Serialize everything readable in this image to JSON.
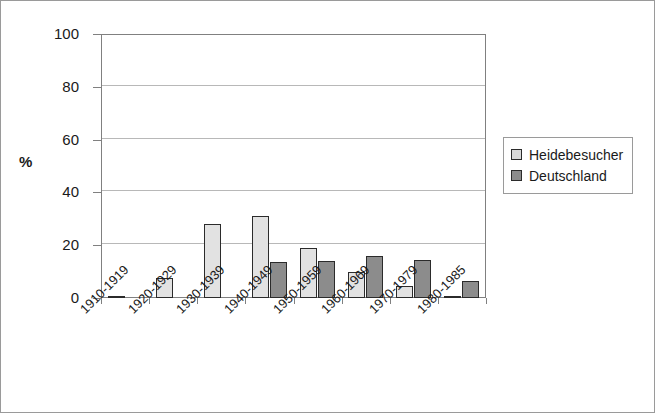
{
  "chart_data": {
    "type": "bar",
    "title": "",
    "subtitle": "",
    "xlabel": "",
    "ylabel": "%",
    "ylim": [
      0,
      100
    ],
    "yticks": [
      0,
      20,
      40,
      60,
      80,
      100
    ],
    "grid": true,
    "legend_position": "right",
    "categories": [
      "1910-1919",
      "1920-1929",
      "1930-1939",
      "1940-1949",
      "1950-1959",
      "1960-1969",
      "1970-1979",
      "1980-1985"
    ],
    "series": [
      {
        "name": "Heidebesucher",
        "color": "#e2e2e2",
        "values": [
          0.5,
          7.5,
          28,
          31,
          19,
          10,
          4.5,
          0.5
        ]
      },
      {
        "name": "Deutschland",
        "color": "#8c8c8c",
        "values": [
          0,
          0,
          0,
          13.5,
          14,
          16,
          14.5,
          6.5
        ]
      }
    ]
  },
  "axes": {
    "y_title": "%",
    "y_tick_labels": [
      "0",
      "20",
      "40",
      "60",
      "80",
      "100"
    ]
  },
  "legend": {
    "entries": [
      {
        "label": "Heidebesucher"
      },
      {
        "label": "Deutschland"
      }
    ]
  }
}
